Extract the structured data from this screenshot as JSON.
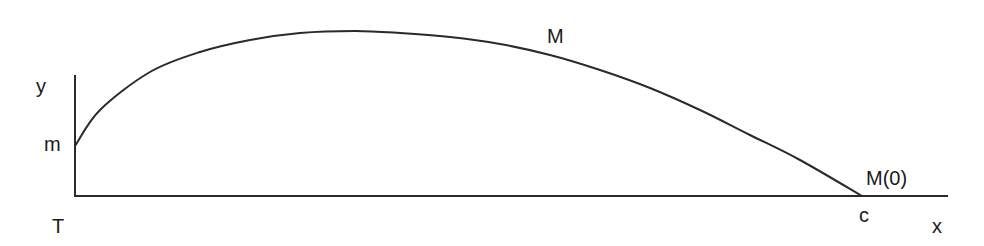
{
  "diagram": {
    "labels": {
      "y_axis": "y",
      "x_axis": "x",
      "origin": "T",
      "y_intercept": "m",
      "curve_point": "M",
      "x_intercept": "c",
      "end_point": "M(0)"
    },
    "colors": {
      "stroke": "#2a2a2a",
      "text": "#1a1a1a",
      "background": "#ffffff"
    },
    "curve_points": [
      [
        75,
        146
      ],
      [
        100,
        110
      ],
      [
        150,
        72
      ],
      [
        200,
        52
      ],
      [
        250,
        40
      ],
      [
        300,
        33
      ],
      [
        355,
        31
      ],
      [
        400,
        33
      ],
      [
        450,
        37
      ],
      [
        500,
        44
      ],
      [
        550,
        55
      ],
      [
        600,
        70
      ],
      [
        650,
        88
      ],
      [
        700,
        110
      ],
      [
        750,
        135
      ],
      [
        800,
        160
      ],
      [
        862,
        196
      ]
    ]
  }
}
